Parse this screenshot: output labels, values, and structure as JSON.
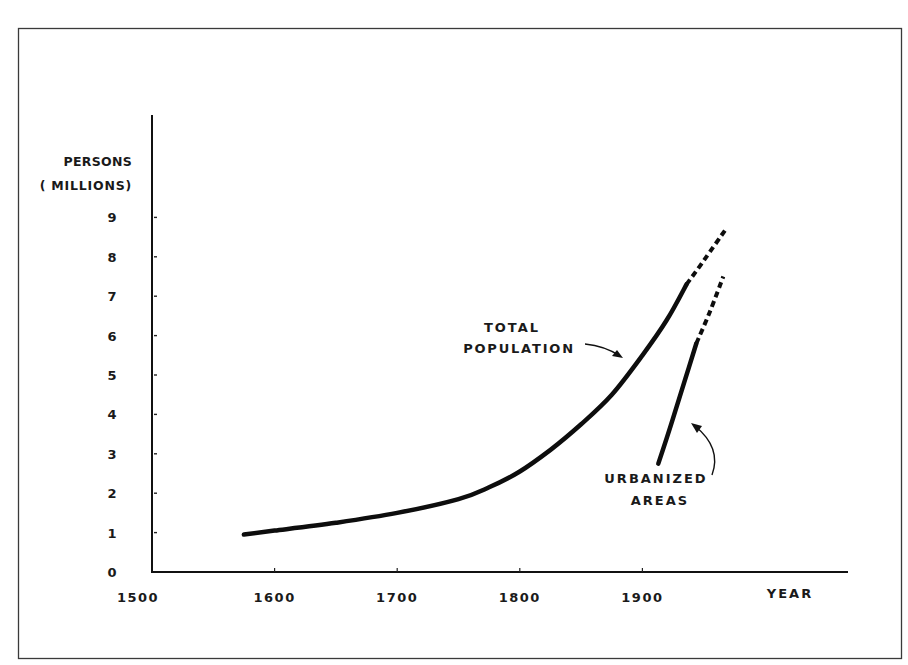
{
  "chart_data": {
    "type": "line",
    "title": "",
    "xlabel": "YEAR",
    "ylabel": "PERSONS (MILLIONS)",
    "ylabel_lines": [
      "PERSONS",
      "( MILLIONS)"
    ],
    "xlim": [
      1500,
      1975
    ],
    "ylim": [
      0,
      9.5
    ],
    "x_ticks": [
      1500,
      1600,
      1700,
      1800,
      1900
    ],
    "x_tick_labels": [
      "1500",
      "1600",
      "1700",
      "1800",
      "1900"
    ],
    "y_ticks": [
      0,
      1,
      2,
      3,
      4,
      5,
      6,
      7,
      8,
      9
    ],
    "y_tick_labels": [
      "0",
      "1",
      "2",
      "3",
      "4",
      "5",
      "6",
      "7",
      "8",
      "9"
    ],
    "grid": false,
    "legend": "none (direct annotations with arrows)",
    "series": [
      {
        "name": "TOTAL POPULATION",
        "annotation_lines": [
          "TOTAL",
          "POPULATION"
        ],
        "style": "solid then dashed (projection)",
        "solid": {
          "x": [
            1575,
            1600,
            1650,
            1700,
            1750,
            1775,
            1800,
            1825,
            1850,
            1875,
            1900,
            1920,
            1936
          ],
          "y": [
            0.95,
            1.05,
            1.25,
            1.5,
            1.85,
            2.15,
            2.55,
            3.1,
            3.75,
            4.5,
            5.5,
            6.4,
            7.3
          ]
        },
        "dashed": {
          "x": [
            1936,
            1950,
            1968
          ],
          "y": [
            7.3,
            7.9,
            8.7
          ]
        }
      },
      {
        "name": "URBANIZED AREAS",
        "annotation_lines": [
          "URBANIZED",
          "AREAS"
        ],
        "style": "solid then dashed (projection)",
        "solid": {
          "x": [
            1913,
            1925,
            1935,
            1944
          ],
          "y": [
            2.75,
            3.9,
            4.9,
            5.8
          ]
        },
        "dashed": {
          "x": [
            1944,
            1955,
            1966
          ],
          "y": [
            5.8,
            6.6,
            7.5
          ]
        }
      }
    ]
  }
}
